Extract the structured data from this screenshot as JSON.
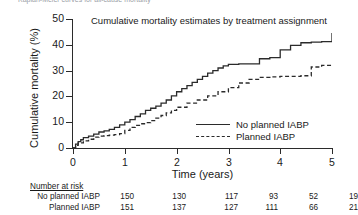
{
  "top_clipped_text": "Kaplan-Meier curves for all-cause mortality",
  "chart_title": "Cumulative mortality estimates by treatment assignment",
  "axes": {
    "ylabel": "Cumulative mortality (%)",
    "xlabel": "Time (years)",
    "yticks": [
      "50",
      "40",
      "30",
      "20",
      "10",
      "0"
    ],
    "xticks": [
      "0",
      "1",
      "2",
      "3",
      "4",
      "5"
    ]
  },
  "legend": {
    "position": "inside-lower-right",
    "items": [
      {
        "label": "No planned IABP",
        "style": "solid"
      },
      {
        "label": "Planned IABP",
        "style": "dashed"
      }
    ]
  },
  "risk_table": {
    "title": "Number at risk",
    "rows": [
      {
        "name": "No planned IABP",
        "values": [
          "150",
          "130",
          "117",
          "93",
          "52",
          "19"
        ]
      },
      {
        "name": "Planned IABP",
        "values": [
          "151",
          "137",
          "127",
          "111",
          "66",
          "21"
        ]
      }
    ]
  },
  "chart_data": {
    "type": "line",
    "title": "Cumulative mortality estimates by treatment assignment",
    "xlabel": "Time (years)",
    "ylabel": "Cumulative mortality (%)",
    "xlim": [
      0,
      5
    ],
    "ylim": [
      0,
      50
    ],
    "grid": false,
    "legend_position": "inside-lower-right",
    "series": [
      {
        "name": "No planned IABP",
        "style": "solid",
        "color": "#2b2b2b",
        "x": [
          0,
          0.05,
          0.1,
          0.15,
          0.2,
          0.3,
          0.4,
          0.5,
          0.6,
          0.7,
          0.8,
          0.9,
          1.0,
          1.1,
          1.2,
          1.3,
          1.4,
          1.5,
          1.6,
          1.7,
          1.8,
          1.9,
          2.0,
          2.1,
          2.2,
          2.3,
          2.4,
          2.5,
          2.6,
          2.7,
          2.8,
          2.9,
          3.0,
          3.2,
          3.4,
          3.6,
          3.8,
          4.0,
          4.2,
          4.4,
          4.6,
          4.8,
          5.0
        ],
        "y": [
          0,
          1.5,
          2.5,
          3.2,
          4.0,
          4.6,
          5.4,
          6.2,
          6.6,
          7.2,
          8.0,
          9.0,
          10.0,
          11.0,
          12.2,
          13.2,
          14.6,
          15.4,
          16.2,
          17.4,
          18.6,
          20.2,
          21.8,
          23.0,
          24.2,
          25.4,
          26.6,
          27.8,
          29.0,
          30.0,
          31.0,
          31.8,
          32.4,
          32.6,
          32.6,
          34.6,
          35.0,
          38.0,
          39.8,
          40.8,
          41.0,
          41.2,
          44.6
        ]
      },
      {
        "name": "Planned IABP",
        "style": "dashed",
        "color": "#2b2b2b",
        "x": [
          0,
          0.05,
          0.1,
          0.2,
          0.3,
          0.4,
          0.5,
          0.6,
          0.7,
          0.8,
          0.9,
          1.0,
          1.1,
          1.2,
          1.3,
          1.4,
          1.5,
          1.6,
          1.7,
          1.8,
          1.9,
          2.0,
          2.2,
          2.4,
          2.6,
          2.8,
          3.0,
          3.2,
          3.4,
          3.6,
          3.8,
          4.0,
          4.2,
          4.4,
          4.6,
          4.8,
          5.0
        ],
        "y": [
          0,
          1.0,
          2.0,
          2.8,
          3.4,
          4.2,
          4.6,
          4.8,
          5.0,
          5.2,
          5.6,
          6.8,
          8.0,
          8.8,
          9.4,
          9.8,
          10.6,
          11.6,
          12.6,
          13.6,
          14.6,
          15.8,
          17.4,
          18.6,
          20.2,
          21.8,
          23.4,
          25.2,
          26.6,
          27.4,
          27.6,
          27.8,
          27.8,
          28.0,
          31.4,
          32.0,
          32.2
        ]
      }
    ]
  }
}
